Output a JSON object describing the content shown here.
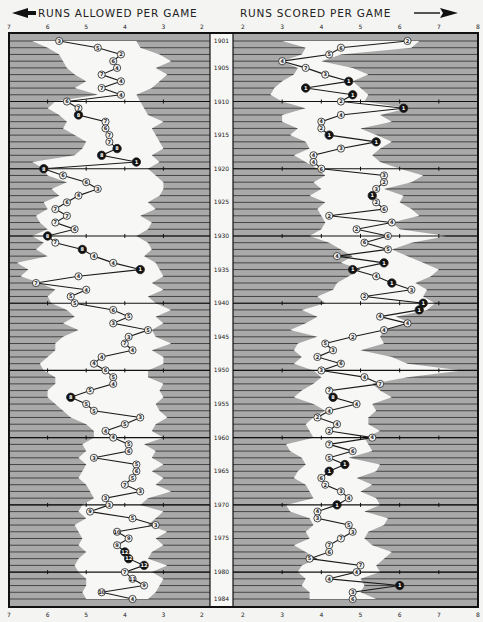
{
  "header": {
    "left_title": "RUNS ALLOWED PER GAME",
    "right_title": "RUNS SCORED PER GAME"
  },
  "colors": {
    "background": "#f4f4f2",
    "panel_gray": "#a9a9a9",
    "stripe": "#3a3a3a",
    "envelope": "#f7f7f5",
    "line": "#1a1a1a",
    "first_place_marker": "#111111",
    "other_marker": "#f2f2f2"
  },
  "chart_data": {
    "type": "line",
    "layout": {
      "left_axis": {
        "label": "RUNS ALLOWED PER GAME",
        "direction": "reversed",
        "range": [
          7,
          2
        ],
        "ticks": [
          "7",
          "6",
          "5",
          "4",
          "3",
          "2"
        ]
      },
      "right_axis": {
        "label": "RUNS SCORED PER GAME",
        "range": [
          2,
          8
        ],
        "ticks": [
          "2",
          "3",
          "4",
          "5",
          "6",
          "7",
          "8"
        ]
      },
      "year_axis": {
        "range": [
          1901,
          1984
        ],
        "labels": [
          "1901",
          "1905",
          "1910",
          "1915",
          "1920",
          "1925",
          "1930",
          "1935",
          "1940",
          "1945",
          "1950",
          "1955",
          "1960",
          "1965",
          "1970",
          "1975",
          "1980",
          "1984"
        ]
      },
      "shaded_band": "white envelope = league range (min to max) each season; gray = outside league range",
      "markers": "circle with finishing position; filled black = 1st place (or notable)"
    },
    "x": [
      1901,
      1902,
      1903,
      1904,
      1905,
      1906,
      1907,
      1908,
      1909,
      1910,
      1911,
      1912,
      1913,
      1914,
      1915,
      1916,
      1917,
      1918,
      1919,
      1920,
      1921,
      1922,
      1923,
      1924,
      1925,
      1926,
      1927,
      1928,
      1929,
      1930,
      1931,
      1932,
      1933,
      1934,
      1935,
      1936,
      1937,
      1938,
      1939,
      1940,
      1941,
      1942,
      1943,
      1944,
      1945,
      1946,
      1947,
      1948,
      1949,
      1950,
      1951,
      1952,
      1953,
      1954,
      1955,
      1956,
      1957,
      1958,
      1959,
      1960,
      1961,
      1962,
      1963,
      1964,
      1965,
      1966,
      1967,
      1968,
      1969,
      1970,
      1971,
      1972,
      1973,
      1974,
      1975,
      1976,
      1977,
      1978,
      1979,
      1980,
      1981,
      1982,
      1983,
      1984
    ],
    "series": [
      {
        "name": "Runs allowed per game",
        "values": [
          5.7,
          4.7,
          4.1,
          4.3,
          4.2,
          4.6,
          4.1,
          4.6,
          4.1,
          5.5,
          5.2,
          5.2,
          4.5,
          4.5,
          4.4,
          4.4,
          4.2,
          4.6,
          3.7,
          6.1,
          5.6,
          5.0,
          4.7,
          5.2,
          5.5,
          5.8,
          5.5,
          5.8,
          5.3,
          6.0,
          5.8,
          5.1,
          4.8,
          4.3,
          3.6,
          5.2,
          6.3,
          5.0,
          5.4,
          5.3,
          4.3,
          3.9,
          4.3,
          3.4,
          3.9,
          4.0,
          3.8,
          4.6,
          4.8,
          4.5,
          4.3,
          4.3,
          4.9,
          5.4,
          5.0,
          4.8,
          3.6,
          4.0,
          4.5,
          4.3,
          3.9,
          3.9,
          4.8,
          3.7,
          3.7,
          3.8,
          4.0,
          3.6,
          4.5,
          4.4,
          4.9,
          3.8,
          3.2,
          4.2,
          3.9,
          4.2,
          4.0,
          3.9,
          3.5,
          4.0,
          3.8,
          3.5,
          4.6,
          3.8
        ],
        "finish": [
          3,
          5,
          2,
          6,
          4,
          7,
          4,
          7,
          4,
          6,
          7,
          8,
          7,
          6,
          7,
          7,
          8,
          8,
          1,
          8,
          6,
          6,
          3,
          4,
          6,
          7,
          7,
          7,
          6,
          8,
          7,
          8,
          4,
          4,
          1,
          4,
          7,
          4,
          5,
          5,
          6,
          5,
          3,
          5,
          3,
          7,
          4,
          4,
          4,
          6,
          5,
          4,
          5,
          8,
          5,
          5,
          3,
          5,
          4,
          4,
          5,
          6,
          3,
          5,
          6,
          5,
          7,
          3,
          3,
          3,
          9,
          5,
          3,
          10,
          9,
          9,
          12,
          12,
          12,
          7,
          11,
          9,
          10,
          4
        ]
      },
      {
        "name": "Runs scored per game",
        "values": [
          6.2,
          4.5,
          4.2,
          3.0,
          3.6,
          4.1,
          4.7,
          3.6,
          4.8,
          4.5,
          6.1,
          4.5,
          4.0,
          4.0,
          4.2,
          5.4,
          4.5,
          3.8,
          3.8,
          4.0,
          5.6,
          5.6,
          5.4,
          5.3,
          5.4,
          5.6,
          4.2,
          5.8,
          4.9,
          5.7,
          5.1,
          5.7,
          4.4,
          5.6,
          4.8,
          5.4,
          5.8,
          6.3,
          5.1,
          6.6,
          6.5,
          5.5,
          6.2,
          5.6,
          4.8,
          4.1,
          4.3,
          3.9,
          4.5,
          4.0,
          5.1,
          5.5,
          4.2,
          4.3,
          4.9,
          4.2,
          3.9,
          4.4,
          4.2,
          5.3,
          4.2,
          4.8,
          4.2,
          4.6,
          4.2,
          4.0,
          4.1,
          4.5,
          4.7,
          4.4,
          3.9,
          3.9,
          4.7,
          4.8,
          4.5,
          4.2,
          4.2,
          3.7,
          5.0,
          4.9,
          4.2,
          6.0,
          4.8,
          4.8
        ],
        "finish": [
          2,
          6,
          5,
          4,
          7,
          3,
          1,
          1,
          1,
          2,
          1,
          4,
          4,
          2,
          1,
          1,
          3,
          4,
          4,
          6,
          3,
          2,
          3,
          1,
          2,
          6,
          2,
          4,
          2,
          6,
          6,
          5,
          4,
          1,
          1,
          4,
          1,
          3,
          2,
          1,
          1,
          4,
          4,
          4,
          2,
          5,
          3,
          2,
          6,
          3,
          4,
          7,
          7,
          8,
          4,
          4,
          2,
          4,
          2,
          4,
          7,
          6,
          5,
          1,
          1,
          6,
          2,
          3,
          4,
          1,
          4,
          3,
          5,
          3,
          7,
          7,
          6,
          5,
          7,
          4,
          4,
          1,
          3,
          6
        ]
      }
    ],
    "envelope_left": {
      "min": [
        6.4,
        6.0,
        5.7,
        5.6,
        5.5,
        5.3,
        5.0,
        5.3,
        4.7,
        5.8,
        6.0,
        5.7,
        5.5,
        5.6,
        5.3,
        5.0,
        5.1,
        5.3,
        6.4,
        6.1,
        6.0,
        5.5,
        5.9,
        5.7,
        6.1,
        6.0,
        6.3,
        6.2,
        6.0,
        6.4,
        6.1,
        6.3,
        6.0,
        6.8,
        6.5,
        6.7,
        6.2,
        5.8,
        6.0,
        5.9,
        5.5,
        5.3,
        5.6,
        5.2,
        5.6,
        5.8,
        5.8,
        6.0,
        6.2,
        6.1,
        5.8,
        5.8,
        6.0,
        6.0,
        5.8,
        5.6,
        5.4,
        5.0,
        4.8,
        4.8,
        5.1,
        5.0,
        5.2,
        5.0,
        5.1,
        5.2,
        5.0,
        4.9,
        4.8,
        5.1,
        5.2,
        5.0,
        5.3,
        5.2,
        5.1,
        5.2,
        5.0,
        5.2,
        5.3,
        5.2,
        5.0,
        5.0,
        5.1,
        5.0
      ],
      "max": [
        3.7,
        3.6,
        3.1,
        2.8,
        3.2,
        2.9,
        3.1,
        3.3,
        3.7,
        3.6,
        3.5,
        3.4,
        3.0,
        3.3,
        3.2,
        3.1,
        3.0,
        3.3,
        3.1,
        3.4,
        3.2,
        3.0,
        3.0,
        3.1,
        3.4,
        3.2,
        3.6,
        3.3,
        3.4,
        3.7,
        3.4,
        3.3,
        3.5,
        3.2,
        3.1,
        3.0,
        3.3,
        3.0,
        3.4,
        3.2,
        2.8,
        3.2,
        3.0,
        3.3,
        3.2,
        2.8,
        3.3,
        3.0,
        3.0,
        3.4,
        3.4,
        3.0,
        3.1,
        3.0,
        3.2,
        3.1,
        2.9,
        3.2,
        3.3,
        3.0,
        3.5,
        3.2,
        3.3,
        3.0,
        3.3,
        3.0,
        3.2,
        2.8,
        3.4,
        3.6,
        3.0,
        3.2,
        3.4,
        2.9,
        3.2,
        3.0,
        3.3,
        3.4,
        2.9,
        3.3,
        3.0,
        3.1,
        3.2,
        3.4
      ]
    },
    "envelope_right": {
      "min": [
        3.0,
        3.6,
        3.5,
        3.0,
        3.4,
        3.3,
        3.0,
        2.8,
        2.7,
        3.0,
        3.6,
        3.0,
        3.0,
        3.4,
        3.2,
        3.6,
        3.7,
        3.3,
        3.6,
        3.9,
        4.1,
        3.8,
        4.0,
        3.7,
        4.1,
        3.9,
        4.0,
        4.1,
        4.0,
        3.7,
        4.2,
        4.5,
        4.8,
        4.5,
        5.0,
        4.7,
        4.4,
        4.3,
        3.9,
        4.1,
        3.5,
        3.9,
        3.6,
        3.2,
        3.9,
        3.4,
        3.3,
        3.5,
        3.3,
        3.8,
        4.0,
        3.8,
        3.5,
        3.3,
        3.8,
        4.1,
        3.8,
        3.6,
        3.7,
        3.8,
        3.1,
        3.2,
        3.5,
        3.6,
        3.4,
        3.3,
        3.6,
        3.7,
        3.8,
        3.1,
        3.2,
        3.7,
        3.8,
        3.6,
        3.7,
        3.3,
        3.6,
        3.9,
        3.5,
        3.4,
        3.6,
        3.5,
        3.7,
        3.7
      ],
      "max": [
        6.5,
        6.3,
        4.5,
        4.0,
        4.8,
        5.2,
        4.8,
        5.0,
        5.2,
        5.1,
        6.2,
        5.5,
        5.8,
        5.0,
        5.4,
        5.8,
        5.5,
        5.3,
        5.5,
        6.0,
        6.6,
        6.3,
        5.6,
        6.1,
        6.0,
        6.3,
        6.5,
        5.8,
        6.0,
        7.2,
        6.3,
        5.8,
        6.2,
        6.6,
        7.0,
        6.8,
        6.4,
        6.7,
        6.6,
        6.9,
        6.7,
        5.9,
        6.3,
        5.6,
        5.5,
        5.6,
        5.0,
        5.8,
        6.2,
        7.6,
        6.2,
        5.3,
        5.5,
        5.8,
        5.3,
        5.4,
        5.2,
        5.2,
        5.5,
        5.1,
        5.2,
        5.3,
        4.7,
        5.5,
        5.4,
        4.9,
        5.3,
        5.0,
        5.4,
        5.5,
        5.1,
        5.7,
        5.6,
        5.2,
        5.1,
        5.3,
        5.8,
        5.6,
        5.4,
        5.5,
        5.0,
        5.1,
        5.0,
        5.4
      ]
    }
  }
}
